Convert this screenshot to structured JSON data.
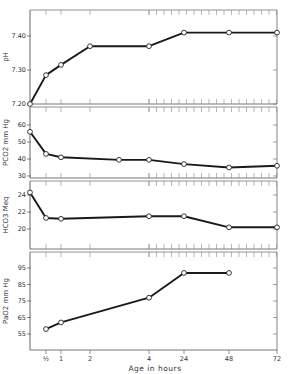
{
  "chart_data": {
    "type": "line",
    "title": "",
    "xlabel": "Age in hours",
    "x_tick_labels": [
      "½",
      "1",
      "2",
      "4",
      "24",
      "48",
      "72"
    ],
    "x_ticks": [
      0.5,
      1,
      2,
      4,
      24,
      48,
      72
    ],
    "grid": false,
    "legend": null,
    "panels": [
      {
        "name": "pH",
        "ylabel": "pH",
        "yticks": [
          7.2,
          7.3,
          7.4
        ],
        "ytick_labels": [
          "7.20",
          "7.30",
          "7.40"
        ],
        "ylim": [
          7.2,
          7.47
        ],
        "x": [
          0,
          0.5,
          1,
          2,
          4,
          24,
          48,
          72
        ],
        "values": [
          7.2,
          7.285,
          7.315,
          7.37,
          7.37,
          7.41,
          7.41,
          7.41
        ]
      },
      {
        "name": "PCO2",
        "ylabel": "PCO2 mm Hg",
        "yticks": [
          30,
          40,
          50,
          60
        ],
        "ytick_labels": [
          "30",
          "40",
          "50",
          "60"
        ],
        "ylim": [
          29,
          68
        ],
        "x": [
          0,
          0.5,
          1,
          3,
          4,
          24,
          48,
          72
        ],
        "values": [
          56,
          43,
          41,
          39.5,
          39.5,
          37,
          35,
          36
        ]
      },
      {
        "name": "HCO3",
        "ylabel": "HCO3 Meq",
        "yticks": [
          20,
          22,
          24
        ],
        "ytick_labels": [
          "20",
          "22",
          "24"
        ],
        "ylim": [
          17.5,
          25.5
        ],
        "x": [
          0,
          0.5,
          1,
          4,
          24,
          48,
          72
        ],
        "values": [
          24.3,
          21.3,
          21.2,
          21.5,
          21.5,
          20.2,
          20.2
        ]
      },
      {
        "name": "PaO2",
        "ylabel": "PaO2 mm Hg",
        "yticks": [
          55,
          65,
          75,
          85,
          95
        ],
        "ytick_labels": [
          "55",
          "65",
          "75",
          "85",
          "95"
        ],
        "ylim": [
          45,
          104
        ],
        "x": [
          0.5,
          1,
          4,
          24,
          48
        ],
        "values": [
          58,
          62,
          77,
          92,
          92
        ]
      }
    ]
  }
}
